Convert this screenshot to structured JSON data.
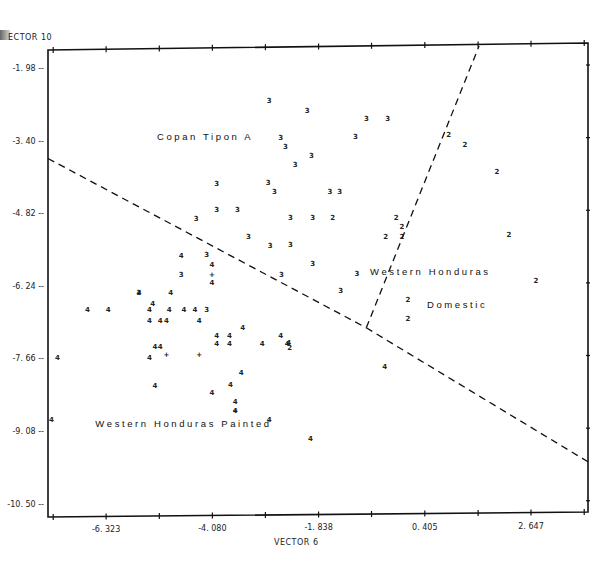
{
  "chart_data": {
    "type": "scatter",
    "title": "",
    "xlabel": "VECTOR  6",
    "ylabel": "VECTOR 10",
    "ylabel_display": "ECTOR 10",
    "xlim": [
      -7.55,
      3.85
    ],
    "ylim": [
      -10.72,
      -1.55
    ],
    "x_ticks": [
      -6.323,
      -4.08,
      -1.838,
      0.405,
      2.647
    ],
    "x_tick_labels": [
      "-6. 323",
      "-4. 080",
      "-1. 838",
      "0. 405",
      "2. 647"
    ],
    "x_minor_ticks": [
      -7.44,
      -5.2,
      -2.96,
      -0.72,
      1.53,
      3.77
    ],
    "y_ticks": [
      -1.98,
      -3.4,
      -4.82,
      -6.24,
      -7.66,
      -9.08,
      -10.5
    ],
    "y_tick_labels": [
      "-1. 98 --",
      "-3. 40 --",
      "-4. 82 --",
      "-6. 24 --",
      "-7. 66 --",
      "-9. 08 --",
      "-10. 50 --"
    ],
    "grid": false,
    "legend": "none",
    "region_labels": [
      {
        "text": "Copan Tipon A",
        "x": -5.25,
        "y": -3.38
      },
      {
        "text": "Western Honduras",
        "x": -0.75,
        "y": -6.02
      },
      {
        "text": "Domestic",
        "x": 0.45,
        "y": -6.68
      },
      {
        "text": "Western Honduras Painted",
        "x": -6.55,
        "y": -8.99
      }
    ],
    "boundaries": [
      {
        "name": "boundary-left",
        "points": [
          [
            -7.55,
            -3.75
          ],
          [
            -0.83,
            -7.06
          ]
        ]
      },
      {
        "name": "boundary-right",
        "points": [
          [
            -0.83,
            -7.06
          ],
          [
            1.55,
            -1.55
          ]
        ]
      },
      {
        "name": "boundary-lower-right",
        "points": [
          [
            -0.83,
            -7.06
          ],
          [
            3.85,
            -9.68
          ]
        ]
      }
    ],
    "series": [
      {
        "name": "Group 3 (Copan Tipon A)",
        "marker": "3",
        "points": [
          [
            -2.88,
            -2.62
          ],
          [
            -2.08,
            -2.82
          ],
          [
            -0.83,
            -2.97
          ],
          [
            -0.38,
            -2.97
          ],
          [
            -2.64,
            -3.35
          ],
          [
            -2.54,
            -3.53
          ],
          [
            -1.06,
            -3.33
          ],
          [
            -1.99,
            -3.7
          ],
          [
            -2.33,
            -3.88
          ],
          [
            -3.99,
            -4.25
          ],
          [
            -2.9,
            -4.23
          ],
          [
            -2.77,
            -4.41
          ],
          [
            -1.6,
            -4.41
          ],
          [
            -1.39,
            -4.41
          ],
          [
            -4.42,
            -4.94
          ],
          [
            -3.99,
            -4.76
          ],
          [
            -3.55,
            -4.76
          ],
          [
            -2.43,
            -4.92
          ],
          [
            -1.96,
            -4.92
          ],
          [
            -3.32,
            -5.29
          ],
          [
            -2.86,
            -5.47
          ],
          [
            -2.43,
            -5.45
          ],
          [
            -4.2,
            -5.64
          ],
          [
            -4.74,
            -6.02
          ],
          [
            -2.62,
            -6.02
          ],
          [
            -1.96,
            -5.82
          ],
          [
            -1.03,
            -6.0
          ],
          [
            -1.37,
            -6.35
          ],
          [
            -5.63,
            -6.39
          ],
          [
            -4.2,
            -6.72
          ]
        ]
      },
      {
        "name": "Group 2 (Western Honduras Domestic)",
        "marker": "2",
        "points": [
          [
            0.91,
            -3.29
          ],
          [
            1.25,
            -3.49
          ],
          [
            1.93,
            -4.02
          ],
          [
            -1.54,
            -4.92
          ],
          [
            -0.2,
            -4.92
          ],
          [
            -0.08,
            -5.1
          ],
          [
            -0.42,
            -5.29
          ],
          [
            -0.08,
            -5.29
          ],
          [
            2.18,
            -5.25
          ],
          [
            2.75,
            -6.14
          ],
          [
            0.05,
            -6.51
          ],
          [
            0.05,
            -6.88
          ],
          [
            -2.45,
            -7.45
          ]
        ]
      },
      {
        "name": "Group 4 (Western Honduras Painted)",
        "marker": "4",
        "points": [
          [
            -4.74,
            -5.66
          ],
          [
            -4.09,
            -5.84
          ],
          [
            -4.09,
            -6.18
          ],
          [
            -5.63,
            -6.39
          ],
          [
            -4.96,
            -6.39
          ],
          [
            -5.34,
            -6.59
          ],
          [
            -6.72,
            -6.72
          ],
          [
            -6.28,
            -6.72
          ],
          [
            -5.41,
            -6.72
          ],
          [
            -4.99,
            -6.72
          ],
          [
            -4.68,
            -6.72
          ],
          [
            -4.45,
            -6.72
          ],
          [
            -5.41,
            -6.92
          ],
          [
            -5.18,
            -6.92
          ],
          [
            -5.05,
            -6.92
          ],
          [
            -4.36,
            -6.92
          ],
          [
            -3.44,
            -7.06
          ],
          [
            -3.99,
            -7.23
          ],
          [
            -3.72,
            -7.23
          ],
          [
            -2.64,
            -7.23
          ],
          [
            -2.47,
            -7.35
          ],
          [
            -5.29,
            -7.43
          ],
          [
            -5.18,
            -7.43
          ],
          [
            -3.99,
            -7.37
          ],
          [
            -3.72,
            -7.37
          ],
          [
            -3.03,
            -7.37
          ],
          [
            -2.5,
            -7.37
          ],
          [
            -7.35,
            -7.66
          ],
          [
            -5.41,
            -7.66
          ],
          [
            -3.47,
            -7.94
          ],
          [
            -5.29,
            -8.2
          ],
          [
            -3.7,
            -8.18
          ],
          [
            -4.09,
            -8.33
          ],
          [
            -3.6,
            -8.51
          ],
          [
            -3.6,
            -8.68
          ],
          [
            -2.88,
            -8.86
          ],
          [
            -7.48,
            -8.86
          ],
          [
            -2.01,
            -9.23
          ],
          [
            -0.44,
            -7.82
          ]
        ]
      },
      {
        "name": "Group mean markers",
        "marker": "+",
        "points": [
          [
            -4.09,
            -6.02
          ],
          [
            -5.05,
            -7.6
          ],
          [
            -4.36,
            -7.6
          ],
          [
            -3.6,
            -8.68
          ]
        ]
      }
    ]
  }
}
